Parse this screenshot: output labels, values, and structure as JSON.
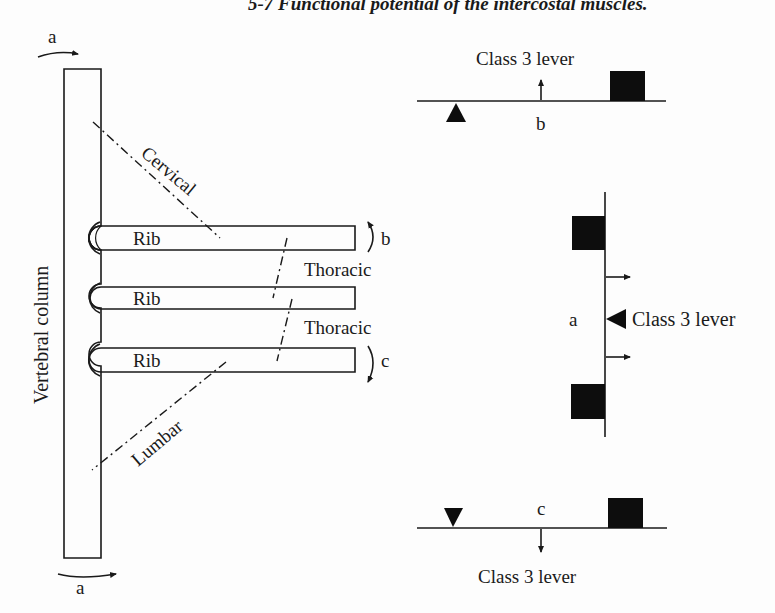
{
  "caption": "5-7 Functional potential of the intercostal muscles.",
  "left_diagram": {
    "column_label": "Vertebral column",
    "rotation_label_top": "a",
    "rotation_label_bottom": "a",
    "ribs": [
      {
        "label": "Rib"
      },
      {
        "label": "Rib"
      },
      {
        "label": "Rib"
      }
    ],
    "regions": {
      "cervical": "Cervical",
      "thoracic_upper": "Thoracic",
      "thoracic_lower": "Thoracic",
      "lumbar": "Lumbar"
    },
    "motion_labels": {
      "up": "b",
      "down": "c"
    }
  },
  "lever_b": {
    "title": "Class 3 lever",
    "letter": "b"
  },
  "lever_a": {
    "title": "Class 3 lever",
    "letter": "a"
  },
  "lever_c": {
    "title": "Class 3 lever",
    "letter": "c"
  }
}
